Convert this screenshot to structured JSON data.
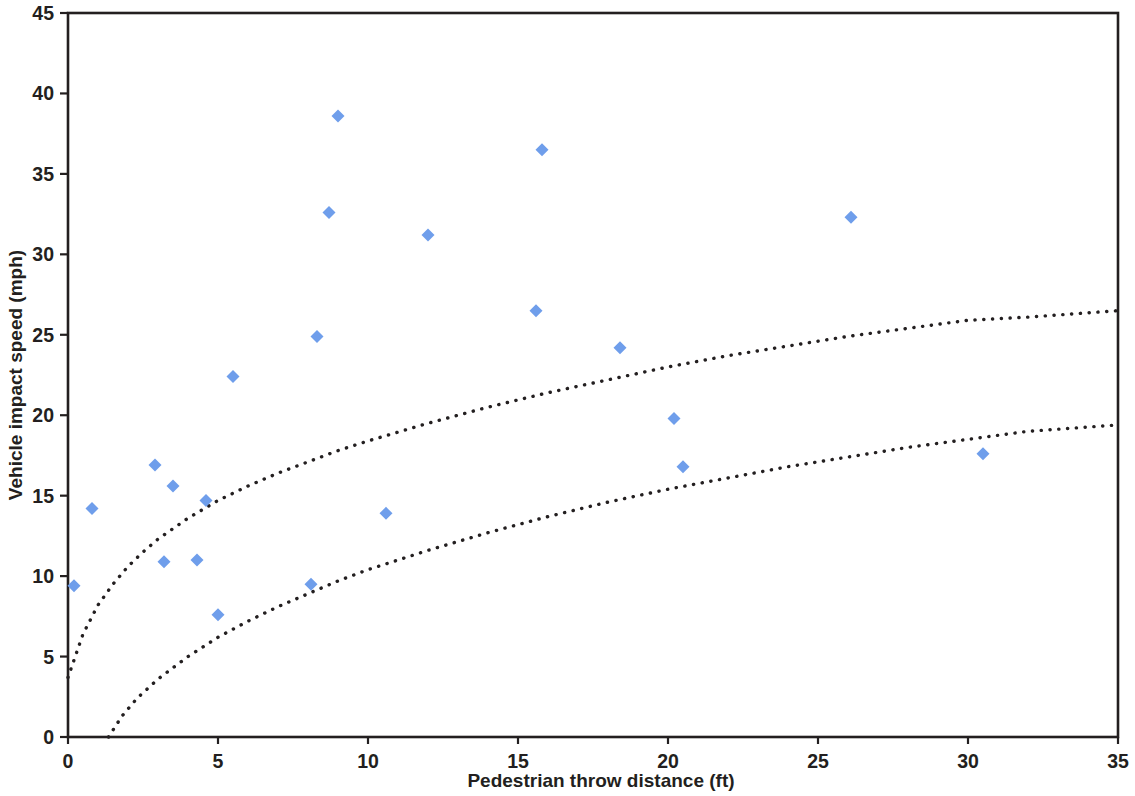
{
  "chart_data": {
    "type": "scatter",
    "title": "",
    "xlabel": "Pedestrian throw distance (ft)",
    "ylabel": "Vehicle impact speed (mph)",
    "xlim": [
      0,
      35
    ],
    "ylim": [
      0,
      45
    ],
    "xticks": [
      0,
      5,
      10,
      15,
      20,
      25,
      30,
      35
    ],
    "yticks": [
      0,
      5,
      10,
      15,
      20,
      25,
      30,
      35,
      40,
      45
    ],
    "xtick_labels": [
      "0",
      "5",
      "10",
      "15",
      "20",
      "25",
      "30",
      "35"
    ],
    "ytick_labels": [
      "0",
      "5",
      "10",
      "15",
      "20",
      "25",
      "30",
      "35",
      "40",
      "45"
    ],
    "grid": false,
    "legend": null,
    "marker": {
      "shape": "diamond",
      "color": "#6f9eeb",
      "size": 13
    },
    "series": [
      {
        "name": "Pedestrian throw data",
        "type": "scatter",
        "points": [
          {
            "x": 0.2,
            "y": 9.4
          },
          {
            "x": 0.8,
            "y": 14.2
          },
          {
            "x": 2.9,
            "y": 16.9
          },
          {
            "x": 3.2,
            "y": 10.9
          },
          {
            "x": 3.5,
            "y": 15.6
          },
          {
            "x": 4.3,
            "y": 11.0
          },
          {
            "x": 4.6,
            "y": 14.7
          },
          {
            "x": 5.0,
            "y": 7.6
          },
          {
            "x": 5.5,
            "y": 22.4
          },
          {
            "x": 8.1,
            "y": 9.5
          },
          {
            "x": 8.3,
            "y": 24.9
          },
          {
            "x": 8.7,
            "y": 32.6
          },
          {
            "x": 9.0,
            "y": 38.6
          },
          {
            "x": 10.6,
            "y": 13.9
          },
          {
            "x": 12.0,
            "y": 31.2
          },
          {
            "x": 15.6,
            "y": 26.5
          },
          {
            "x": 15.8,
            "y": 36.5
          },
          {
            "x": 18.4,
            "y": 24.2
          },
          {
            "x": 20.2,
            "y": 19.8
          },
          {
            "x": 20.5,
            "y": 16.8
          },
          {
            "x": 26.1,
            "y": 32.3
          },
          {
            "x": 30.5,
            "y": 17.6
          }
        ]
      },
      {
        "name": "Upper bound curve",
        "type": "line",
        "style": "dotted",
        "color": "#231f20",
        "points": [
          {
            "x": 0.0,
            "y": 3.7
          },
          {
            "x": 0.5,
            "y": 6.4
          },
          {
            "x": 1.0,
            "y": 8.2
          },
          {
            "x": 1.5,
            "y": 9.5
          },
          {
            "x": 2.0,
            "y": 10.6
          },
          {
            "x": 2.5,
            "y": 11.5
          },
          {
            "x": 3.0,
            "y": 12.3
          },
          {
            "x": 4.0,
            "y": 13.6
          },
          {
            "x": 5.0,
            "y": 14.7
          },
          {
            "x": 6.0,
            "y": 15.6
          },
          {
            "x": 7.0,
            "y": 16.4
          },
          {
            "x": 8.0,
            "y": 17.1
          },
          {
            "x": 9.0,
            "y": 17.8
          },
          {
            "x": 10.0,
            "y": 18.4
          },
          {
            "x": 12.0,
            "y": 19.5
          },
          {
            "x": 14.0,
            "y": 20.5
          },
          {
            "x": 16.0,
            "y": 21.4
          },
          {
            "x": 18.0,
            "y": 22.2
          },
          {
            "x": 20.0,
            "y": 23.0
          },
          {
            "x": 22.0,
            "y": 23.7
          },
          {
            "x": 24.0,
            "y": 24.3
          },
          {
            "x": 26.0,
            "y": 24.9
          },
          {
            "x": 28.0,
            "y": 25.4
          },
          {
            "x": 30.0,
            "y": 25.9
          },
          {
            "x": 32.0,
            "y": 26.1
          },
          {
            "x": 35.0,
            "y": 26.5
          }
        ]
      },
      {
        "name": "Lower bound curve",
        "type": "line",
        "style": "dotted",
        "color": "#231f20",
        "points": [
          {
            "x": 1.35,
            "y": 0.0
          },
          {
            "x": 1.8,
            "y": 1.3
          },
          {
            "x": 2.3,
            "y": 2.4
          },
          {
            "x": 3.0,
            "y": 3.6
          },
          {
            "x": 4.0,
            "y": 5.0
          },
          {
            "x": 5.0,
            "y": 6.2
          },
          {
            "x": 6.0,
            "y": 7.2
          },
          {
            "x": 7.0,
            "y": 8.1
          },
          {
            "x": 8.0,
            "y": 8.9
          },
          {
            "x": 9.0,
            "y": 9.7
          },
          {
            "x": 10.0,
            "y": 10.4
          },
          {
            "x": 12.0,
            "y": 11.6
          },
          {
            "x": 14.0,
            "y": 12.7
          },
          {
            "x": 16.0,
            "y": 13.7
          },
          {
            "x": 18.0,
            "y": 14.6
          },
          {
            "x": 20.0,
            "y": 15.4
          },
          {
            "x": 22.0,
            "y": 16.1
          },
          {
            "x": 24.0,
            "y": 16.8
          },
          {
            "x": 26.0,
            "y": 17.4
          },
          {
            "x": 28.0,
            "y": 18.0
          },
          {
            "x": 30.0,
            "y": 18.5
          },
          {
            "x": 32.0,
            "y": 19.0
          },
          {
            "x": 35.0,
            "y": 19.4
          }
        ]
      }
    ]
  }
}
